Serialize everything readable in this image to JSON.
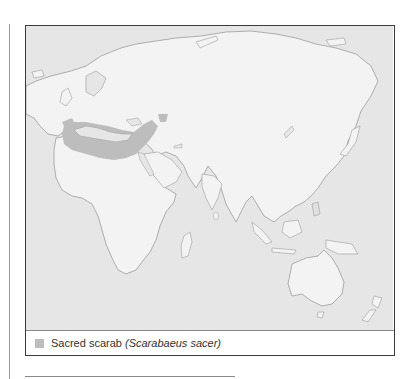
{
  "map": {
    "title": "Sacred scarab distribution",
    "colors": {
      "ocean": "#e6e6e6",
      "land": "#f3f3f3",
      "coast": "#9c9c9c",
      "range": "#bdbdbd",
      "frame": "#3a3a3a"
    },
    "regions_shown": [
      "Europe",
      "Africa",
      "Asia",
      "Australia",
      "New Zealand"
    ],
    "range_region": "Mediterranean Europe, North Africa, Middle East"
  },
  "legend": {
    "items": [
      {
        "swatch_color": "#bdbdbd",
        "common_name": "Sacred scarab",
        "scientific_name": "(Scarabaeus sacer)"
      }
    ]
  }
}
